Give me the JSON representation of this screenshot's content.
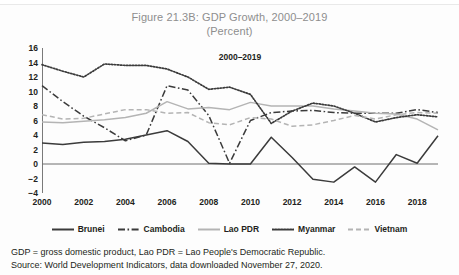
{
  "figure": {
    "title_line1": "Figure 21.3B: GDP Growth, 2000–2019",
    "title_line2": "(Percent)",
    "inplot_note": "2000–2019"
  },
  "notes": {
    "definitions": "GDP = gross domestic product, Lao PDR = Lao People's Democratic Republic.",
    "source": "Source: World Development Indicators, data downloaded November 27, 2020."
  },
  "colors": {
    "dark": "#3b3b3b",
    "gray": "#b4b4b4",
    "axis": "#7a7a7a",
    "zero_line": "#6f6f6f",
    "title": "#8e8e8e",
    "text": "#231f20"
  },
  "legend": {
    "items": [
      {
        "label": "Brunei",
        "style": "solid",
        "color": "#3b3b3b"
      },
      {
        "label": "Cambodia",
        "style": "dash-dot",
        "color": "#3b3b3b"
      },
      {
        "label": "Lao PDR",
        "style": "solid",
        "color": "#b4b4b4"
      },
      {
        "label": "Myanmar",
        "style": "dotted",
        "color": "#3b3b3b"
      },
      {
        "label": "Vietnam",
        "style": "dashed",
        "color": "#b4b4b4"
      }
    ]
  },
  "chart_data": {
    "type": "line",
    "title": "Figure 21.3B: GDP Growth, 2000–2019 (Percent)",
    "xlabel": "",
    "ylabel": "Percent",
    "ylim": [
      -4,
      16
    ],
    "ytick_step": 2,
    "yticks": [
      16,
      14,
      12,
      10,
      8,
      6,
      4,
      2,
      0,
      -2,
      -4
    ],
    "xlim": [
      2000,
      2019
    ],
    "x": [
      2000,
      2001,
      2002,
      2003,
      2004,
      2005,
      2006,
      2007,
      2008,
      2009,
      2010,
      2011,
      2012,
      2013,
      2014,
      2015,
      2016,
      2017,
      2018,
      2019
    ],
    "xtick_labels": [
      "2000",
      "2002",
      "2004",
      "2006",
      "2008",
      "2010",
      "2012",
      "2014",
      "2016",
      "2018"
    ],
    "grid": false,
    "zero_line": true,
    "legend_position": "below",
    "series": [
      {
        "name": "Brunei",
        "style": "solid",
        "color": "#3b3b3b",
        "values": [
          2.9,
          2.7,
          3.0,
          3.1,
          3.4,
          4.0,
          4.6,
          3.1,
          0.1,
          0.0,
          0.0,
          3.7,
          0.9,
          -2.1,
          -2.5,
          -0.4,
          -2.5,
          1.3,
          0.1,
          3.9
        ]
      },
      {
        "name": "Cambodia",
        "style": "dash-dot",
        "color": "#3b3b3b",
        "values": [
          10.8,
          8.6,
          6.6,
          5.0,
          3.2,
          4.0,
          10.8,
          10.2,
          6.7,
          0.1,
          6.0,
          7.1,
          7.3,
          7.4,
          7.1,
          7.0,
          7.0,
          7.0,
          7.5,
          7.1
        ]
      },
      {
        "name": "Lao PDR",
        "style": "solid",
        "color": "#b4b4b4",
        "values": [
          5.8,
          5.7,
          5.9,
          6.1,
          6.4,
          7.0,
          8.6,
          7.6,
          7.8,
          7.5,
          8.5,
          8.0,
          8.0,
          8.0,
          7.6,
          7.3,
          7.0,
          6.9,
          6.2,
          4.7
        ]
      },
      {
        "name": "Myanmar",
        "style": "dotted",
        "color": "#3b3b3b",
        "values": [
          13.7,
          12.8,
          12.0,
          13.8,
          13.6,
          13.6,
          13.1,
          12.0,
          10.3,
          10.6,
          9.6,
          5.6,
          7.3,
          8.4,
          8.0,
          7.0,
          5.8,
          6.4,
          6.8,
          6.5
        ]
      },
      {
        "name": "Vietnam",
        "style": "dashed",
        "color": "#b4b4b4",
        "values": [
          6.8,
          6.2,
          6.3,
          6.9,
          7.5,
          7.5,
          7.0,
          7.1,
          5.7,
          5.4,
          6.4,
          6.2,
          5.2,
          5.4,
          6.0,
          6.7,
          6.2,
          6.8,
          7.1,
          7.0
        ]
      }
    ]
  }
}
